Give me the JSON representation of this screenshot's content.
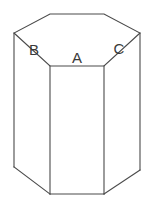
{
  "figure": {
    "background_color": "#ffffff",
    "line_color": "#4a4a4a",
    "label_color": "#3a3a3a",
    "canvas": {
      "width": 154,
      "height": 205
    },
    "labels": [
      {
        "text": "B",
        "x": 34,
        "y": 55
      },
      {
        "text": "A",
        "x": 77,
        "y": 63
      },
      {
        "text": "C",
        "x": 119,
        "y": 54
      }
    ],
    "geometry": {
      "top_face_points": "50,14 104,14 140,33 104,66 50,66 14,33",
      "left_side_face_points": "14,33 50,66 50,194 14,167",
      "front_face_points": "50,66 104,66 104,194 50,194",
      "right_side_face_points": "104,66 140,33 140,170 104,194",
      "top_outline": "M 50,14 L 104,14 L 140,33 L 104,66 L 50,66 L 14,33 Z",
      "edge_left_vertical": "M 14,33 L 14,167",
      "edge_front_left_vertical": "M 50,66 L 50,194",
      "edge_front_right_vertical": "M 104,66 L 104,194",
      "edge_right_vertical": "M 140,33 L 140,170",
      "bottom_left_diagonal": "M 14,167 L 50,194",
      "bottom_front_horizontal": "M 50,194 L 104,194",
      "bottom_right_diagonal": "M 104,194 L 140,170"
    }
  }
}
